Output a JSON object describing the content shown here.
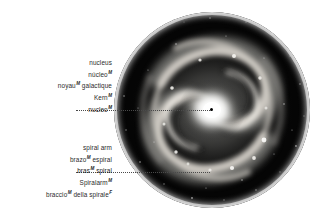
{
  "figure": {
    "image_name": "galaxy-photograph",
    "shape": "circular"
  },
  "callouts": [
    {
      "id": "nucleus",
      "name": "callout-nucleus",
      "lines": [
        {
          "text": "nucleus",
          "gender": "",
          "active": false,
          "lang": "en"
        },
        {
          "text": "núcleo",
          "gender": "M",
          "active": false,
          "lang": "es"
        },
        {
          "text": "noyau",
          "gender": "M",
          "suffix": " galactique",
          "active": false,
          "lang": "fr"
        },
        {
          "text": "Kern",
          "gender": "M",
          "active": false,
          "lang": "de"
        },
        {
          "text": "nucleo",
          "gender": "M",
          "active": true,
          "lang": "it"
        }
      ]
    },
    {
      "id": "spiralarm",
      "name": "callout-spiral-arm",
      "lines": [
        {
          "text": "spiral arm",
          "gender": "",
          "active": false,
          "lang": "en"
        },
        {
          "text": "brazo",
          "gender": "M",
          "suffix": " espiral",
          "active": false,
          "lang": "es"
        },
        {
          "text": "bras",
          "gender": "M",
          "suffix": " spiral",
          "active": true,
          "lang": "fr"
        },
        {
          "text": "Spiralarm",
          "gender": "M",
          "active": false,
          "lang": "de"
        },
        {
          "text": "braccio",
          "gender": "M",
          "suffix": " della spirale",
          "gender2": "F",
          "active": false,
          "lang": "it"
        }
      ]
    }
  ],
  "colors": {
    "background": "#ffffff",
    "text": "#2b2b2b",
    "leader": "#4a4a4a",
    "galaxy_void": "#000000",
    "galaxy_core": "#ffffff"
  }
}
